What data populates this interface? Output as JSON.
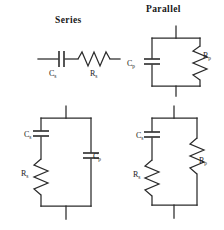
{
  "figure": {
    "background_color": "#ffffff",
    "line_color": "#2b2b2b",
    "headings": {
      "series": "Series",
      "parallel": "Parallel"
    },
    "component_labels": {
      "cs": "C",
      "cs_sub": "s",
      "rs": "R",
      "rs_sub": "s",
      "cp": "C",
      "cp_sub": "p",
      "rp": "R",
      "rp_sub": "p"
    },
    "circuits": [
      {
        "id": "series-circuit",
        "heading": "Series",
        "position": "top-left",
        "topology": "series",
        "elements": [
          "C_s",
          "R_s"
        ]
      },
      {
        "id": "parallel-circuit",
        "heading": "Parallel",
        "position": "top-right",
        "topology": "parallel",
        "elements": [
          "C_p",
          "R_p"
        ]
      },
      {
        "id": "series-cs-rs-parallel-cp-circuit",
        "heading": "",
        "position": "bottom-left",
        "topology": "series-branch-parallel-capacitor",
        "elements": [
          "C_s",
          "R_s",
          "C_p"
        ]
      },
      {
        "id": "series-cs-rs-parallel-rp-circuit",
        "heading": "",
        "position": "bottom-right",
        "topology": "series-branch-parallel-resistor",
        "elements": [
          "C_s",
          "R_s",
          "R_p"
        ]
      }
    ]
  }
}
